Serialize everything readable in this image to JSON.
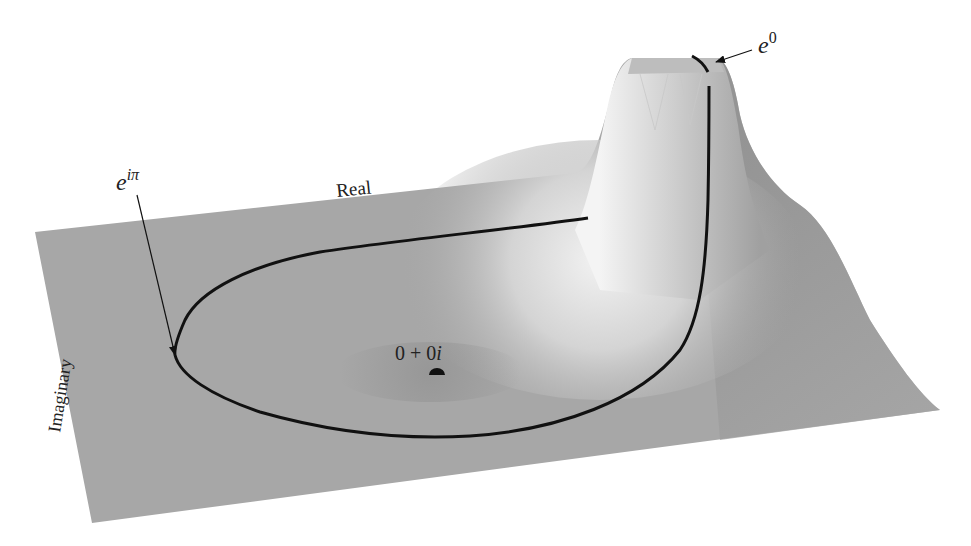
{
  "figure": {
    "axes": {
      "real_label": "Real",
      "imaginary_label": "Imaginary"
    },
    "annotations": {
      "e_i_pi": {
        "base": "e",
        "exponent": "iπ"
      },
      "e_zero": {
        "base": "e",
        "exponent": "0"
      },
      "origin": {
        "text_a": "0 + 0",
        "text_i": "i"
      }
    },
    "colors": {
      "surface": "#a6a6a6",
      "surface_highlight": "#e8e8e8",
      "surface_shadow": "#8f8f8f",
      "curve": "#111111",
      "background": "#ffffff"
    }
  }
}
